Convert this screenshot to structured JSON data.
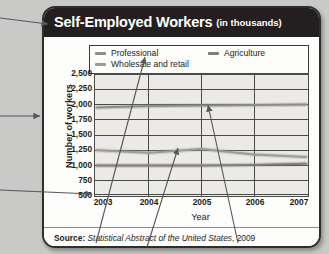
{
  "header": {
    "title": "Self-Employed Workers",
    "subtitle": "(in thousands)"
  },
  "legend": {
    "position": "top-inside",
    "items": [
      {
        "label": "Professional",
        "color": "#8c8c8a"
      },
      {
        "label": "Wholesale and retail",
        "color": "#9a9a97"
      },
      {
        "label": "Agriculture",
        "color": "#7d7d7a"
      }
    ]
  },
  "axes": {
    "ylabel": "Number of workers",
    "xlabel": "Year",
    "yticks": [
      "2,500",
      "2,250",
      "2,000",
      "1,750",
      "1,500",
      "1,250",
      "1,000",
      "750",
      "500"
    ],
    "xticks": [
      "2003",
      "2004",
      "2005",
      "2006",
      "2007"
    ]
  },
  "source": {
    "label": "Source:",
    "text": "Statistical Abstract of the United States",
    "year": ", 2009"
  },
  "chart_data": {
    "type": "line",
    "title": "Self-Employed Workers (in thousands)",
    "xlabel": "Year",
    "ylabel": "Number of workers",
    "categories": [
      "2003",
      "2004",
      "2005",
      "2006",
      "2007"
    ],
    "x": [
      2003,
      2004,
      2005,
      2006,
      2007
    ],
    "xlim": [
      2003,
      2007
    ],
    "ylim": [
      500,
      2500
    ],
    "ytick_step": 250,
    "grid": "both",
    "units": "thousands",
    "legend_position": "top-inside",
    "series": [
      {
        "name": "Professional",
        "values": [
          1950,
          1975,
          1985,
          1990,
          2000
        ],
        "color": "#8c8c8a"
      },
      {
        "name": "Wholesale and retail",
        "values": [
          1250,
          1210,
          1270,
          1180,
          1140
        ],
        "color": "#9a9a97"
      },
      {
        "name": "Agriculture",
        "values": [
          1000,
          1000,
          1000,
          1010,
          1030
        ],
        "color": "#7d7d7a"
      }
    ]
  }
}
